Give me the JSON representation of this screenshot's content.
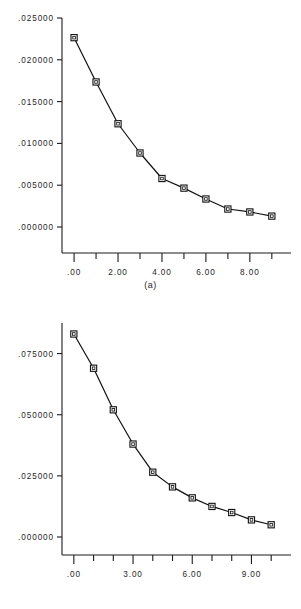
{
  "page": {
    "background_color": "#ffffff",
    "ink_color": "#111111",
    "panel_count": 2
  },
  "chart_data": [
    {
      "id": "a",
      "type": "line",
      "title": "",
      "subtitle": "",
      "caption": "(a)",
      "xlabel": "",
      "ylabel": "",
      "grid": false,
      "legend": null,
      "marker": "open-square",
      "xlim": [
        -0.55,
        9.6
      ],
      "ylim": [
        0.0,
        0.025
      ],
      "ytick_labels": [
        ".025000",
        ".020000",
        ".015000",
        ".010000",
        ".005000",
        ".000000"
      ],
      "ytick_values": [
        0.025,
        0.02,
        0.015,
        0.01,
        0.005,
        0.0
      ],
      "xtick_labels": [
        ".00",
        "2.00",
        "4.00",
        "6.00",
        "8.00"
      ],
      "xtick_values": [
        0,
        2,
        4,
        6,
        8
      ],
      "xtick_minor_values": [
        1,
        3,
        5,
        7,
        9
      ],
      "x": [
        0,
        1,
        2,
        3,
        4,
        5,
        6,
        7,
        8,
        9
      ],
      "values": [
        0.02265,
        0.01735,
        0.01235,
        0.00885,
        0.0058,
        0.00465,
        0.00335,
        0.00215,
        0.0018,
        0.0013
      ]
    },
    {
      "id": "b",
      "type": "line",
      "title": "",
      "subtitle": "",
      "caption": "(b)",
      "xlabel": "",
      "ylabel": "",
      "grid": false,
      "legend": null,
      "marker": "open-square",
      "xlim": [
        -0.6,
        10.7
      ],
      "ylim": [
        0.0,
        0.0875
      ],
      "ytick_labels": [
        ".075000",
        ".050000",
        ".025000",
        ".000000"
      ],
      "ytick_values": [
        0.075,
        0.05,
        0.025,
        0.0
      ],
      "xtick_labels": [
        ".00",
        "3.00",
        "6.00",
        "9.00"
      ],
      "xtick_values": [
        0,
        3,
        6,
        9
      ],
      "xtick_minor_values": [
        1,
        2,
        4,
        5,
        7,
        8,
        10
      ],
      "x": [
        0,
        1,
        2,
        3,
        4,
        5,
        6,
        7,
        8,
        9,
        10
      ],
      "values": [
        0.083,
        0.069,
        0.052,
        0.038,
        0.0265,
        0.0205,
        0.016,
        0.0125,
        0.01,
        0.007,
        0.005
      ]
    }
  ]
}
